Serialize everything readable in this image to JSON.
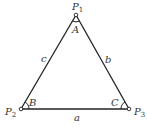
{
  "diagram": {
    "type": "triangle",
    "stroke_color": "#222222",
    "vertices": [
      {
        "name": "P1",
        "label": "P",
        "subscript": "1",
        "angle_label": "A"
      },
      {
        "name": "P2",
        "label": "P",
        "subscript": "2",
        "angle_label": "B"
      },
      {
        "name": "P3",
        "label": "P",
        "subscript": "3",
        "angle_label": "C"
      }
    ],
    "sides": [
      {
        "label": "a",
        "between": "P2-P3"
      },
      {
        "label": "b",
        "between": "P1-P3"
      },
      {
        "label": "c",
        "between": "P1-P2"
      }
    ]
  }
}
